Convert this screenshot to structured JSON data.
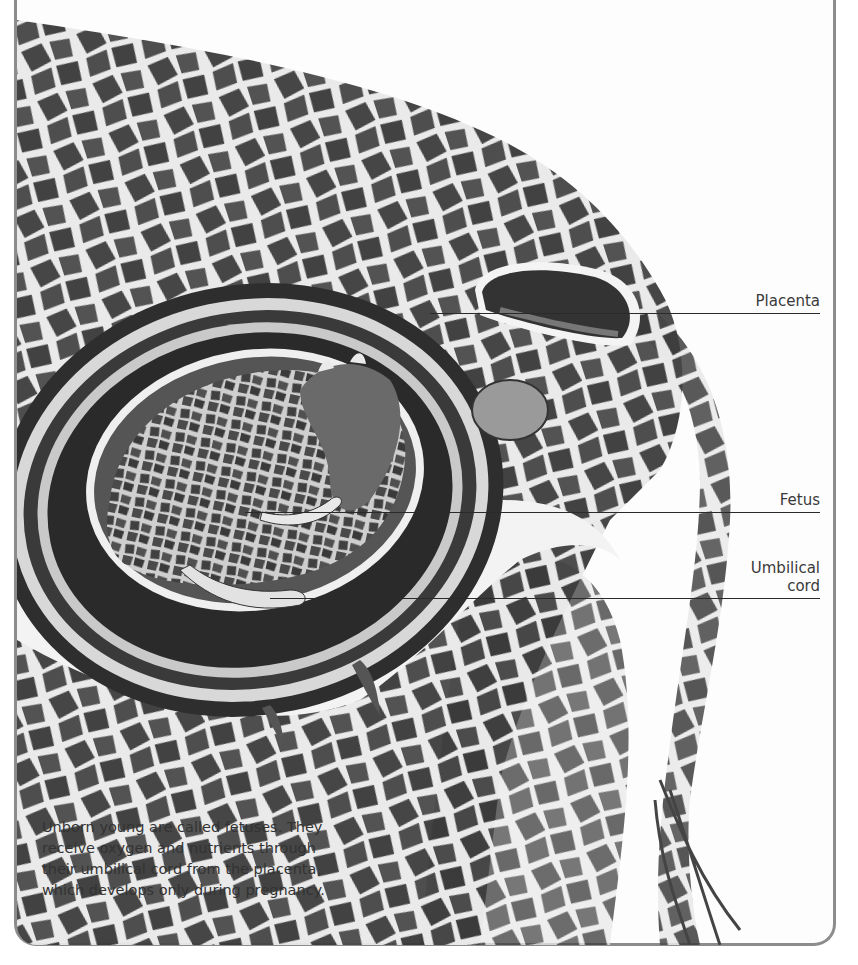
{
  "figure": {
    "labels": [
      {
        "id": "placenta",
        "text": "Placenta"
      },
      {
        "id": "fetus",
        "text": "Fetus"
      },
      {
        "id": "umbilical_cord",
        "text_line1": "Umbilical",
        "text_line2": "cord"
      }
    ],
    "caption": "Unborn young are called fetuses. They receive oxygen and nutrients through their umbilical cord from the placenta, which develops only during pregnancy."
  },
  "colors": {
    "frame_border": "#8c8c8c",
    "label_text": "#3a3a3a",
    "leader_line": "#2a2a2a",
    "background": "#fdfdfd"
  }
}
